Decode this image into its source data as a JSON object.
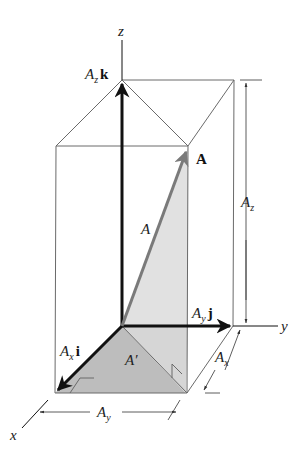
{
  "figure": {
    "axes": {
      "x_label": "x",
      "y_label": "y",
      "z_label": "z"
    },
    "vector": {
      "bold_label": "A",
      "magnitude_label": "A",
      "projection_label": "A",
      "projection_prime": "′"
    },
    "components": {
      "x": {
        "coef": "A",
        "sub": "x",
        "unit": "i"
      },
      "y": {
        "coef": "A",
        "sub": "y",
        "unit": "j"
      },
      "z": {
        "coef": "A",
        "sub": "z",
        "unit": "k"
      }
    },
    "dimensions": {
      "width_y": {
        "main": "A",
        "sub": "y"
      },
      "depth_x": {
        "main": "A",
        "sub": "x"
      },
      "height_z": {
        "main": "A",
        "sub": "z"
      }
    },
    "colors": {
      "line": "#666666",
      "axis": "#111111",
      "vector": "#7a7a7a",
      "shade_light": "#dcdcdc",
      "shade_dark": "#b8b8b8"
    }
  }
}
